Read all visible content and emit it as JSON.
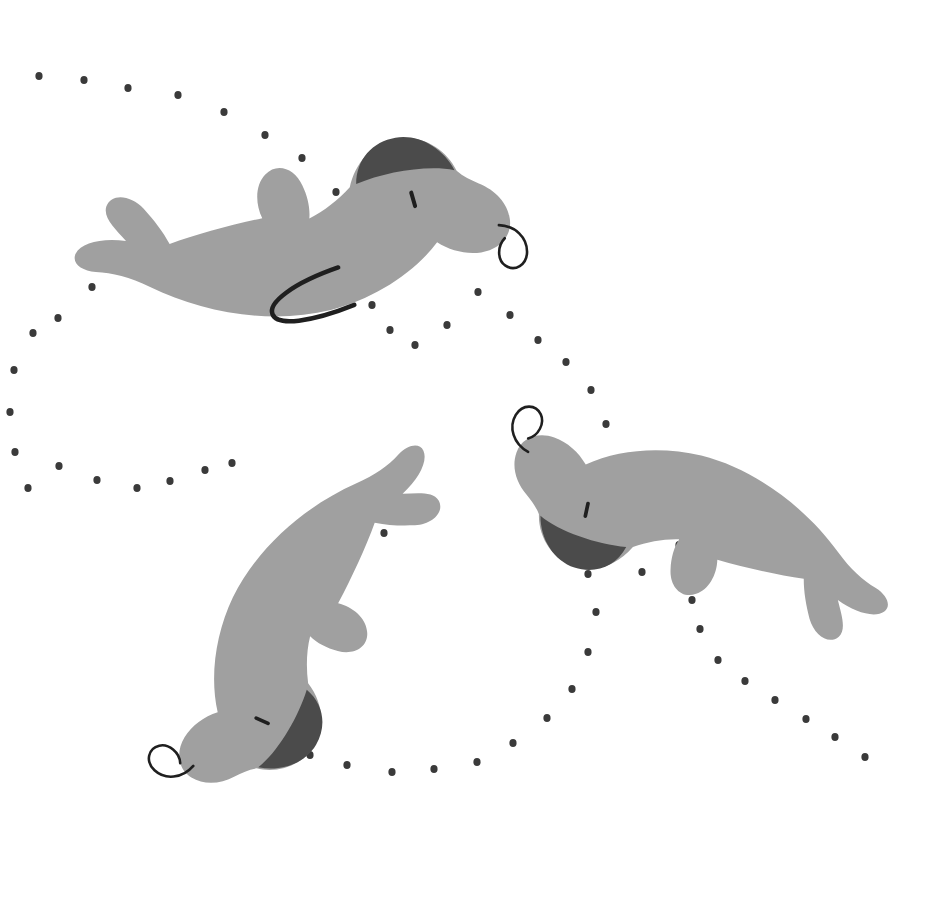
{
  "artwork": {
    "title": "Swimming seals with dotted motion trail",
    "width": 941,
    "height": 916,
    "background_color": "#ffffff",
    "palette": {
      "body": "#a0a0a0",
      "body_shade": "#9a9a9a",
      "cap_dark": "#4b4b4b",
      "line_dark": "#1f1f1f",
      "dot": "#3a3a3a"
    }
  },
  "seals": [
    {
      "name": "seal-top-left",
      "label": "Seal 1",
      "rotation": -12,
      "translate_x": 55,
      "translate_y": 205,
      "scale": 1.0,
      "features": [
        "dark-cap",
        "eye-dash",
        "whisker-curl",
        "belly-line",
        "tail-flippers",
        "side-flipper"
      ]
    },
    {
      "name": "seal-middle",
      "label": "Seal 2",
      "rotation": 118,
      "translate_x": 470,
      "translate_y": 465,
      "scale": 0.92,
      "features": [
        "dark-cap",
        "eye-dash",
        "whisker-curl",
        "tail-flippers",
        "side-flipper"
      ]
    },
    {
      "name": "seal-bottom-right",
      "label": "Seal 3",
      "rotation": 196,
      "translate_x": 880,
      "translate_y": 660,
      "scale": 0.92,
      "features": [
        "dark-cap",
        "eye-dash",
        "whisker-curl",
        "tail-flippers",
        "side-flipper"
      ]
    }
  ],
  "trail": {
    "name": "dotted-motion-trail",
    "dot_radius": 3.6,
    "dot_color": "#3a3a3a",
    "dots": [
      [
        39,
        76
      ],
      [
        84,
        80
      ],
      [
        128,
        88
      ],
      [
        178,
        95
      ],
      [
        224,
        112
      ],
      [
        265,
        135
      ],
      [
        302,
        158
      ],
      [
        336,
        192
      ],
      [
        355,
        232
      ],
      [
        362,
        270
      ],
      [
        372,
        305
      ],
      [
        390,
        330
      ],
      [
        415,
        345
      ],
      [
        447,
        325
      ],
      [
        478,
        292
      ],
      [
        510,
        315
      ],
      [
        538,
        340
      ],
      [
        566,
        362
      ],
      [
        591,
        390
      ],
      [
        606,
        424
      ],
      [
        617,
        462
      ],
      [
        627,
        500
      ],
      [
        633,
        540
      ],
      [
        642,
        572
      ],
      [
        92,
        287
      ],
      [
        58,
        318
      ],
      [
        33,
        333
      ],
      [
        14,
        370
      ],
      [
        10,
        412
      ],
      [
        15,
        452
      ],
      [
        28,
        488
      ],
      [
        59,
        466
      ],
      [
        97,
        480
      ],
      [
        137,
        488
      ],
      [
        170,
        481
      ],
      [
        205,
        470
      ],
      [
        232,
        463
      ],
      [
        657,
        512
      ],
      [
        679,
        545
      ],
      [
        687,
        573
      ],
      [
        692,
        600
      ],
      [
        700,
        629
      ],
      [
        718,
        660
      ],
      [
        745,
        681
      ],
      [
        775,
        700
      ],
      [
        806,
        719
      ],
      [
        835,
        737
      ],
      [
        865,
        757
      ],
      [
        384,
        533
      ],
      [
        332,
        549
      ],
      [
        299,
        575
      ],
      [
        276,
        613
      ],
      [
        259,
        653
      ],
      [
        258,
        691
      ],
      [
        277,
        727
      ],
      [
        310,
        755
      ],
      [
        347,
        765
      ],
      [
        392,
        772
      ],
      [
        434,
        769
      ],
      [
        477,
        762
      ],
      [
        513,
        743
      ],
      [
        547,
        718
      ],
      [
        572,
        689
      ],
      [
        588,
        652
      ],
      [
        596,
        612
      ],
      [
        588,
        574
      ]
    ]
  },
  "body_path": "M 15 68 C 8 60 14 48 28 46 C 44 44 60 52 78 62 C 72 48 68 34 74 24 C 80 14 94 16 102 28 C 112 42 118 56 122 70 C 150 66 182 64 212 62 C 208 48 210 32 220 24 C 232 14 248 20 254 36 C 258 48 258 60 256 70 C 272 66 286 60 298 52 C 308 30 326 16 348 16 C 372 16 392 34 398 56 C 402 62 408 66 414 70 C 428 78 438 92 438 108 C 438 124 424 134 406 134 C 392 134 378 128 368 118 C 340 140 300 154 260 156 C 200 158 140 136 96 104 C 70 88 38 82 15 68 Z"
}
